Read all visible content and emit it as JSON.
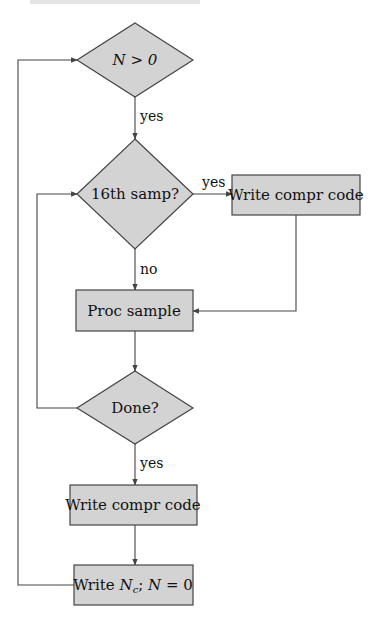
{
  "colors": {
    "node_fill": "#d3d3d3",
    "stroke": "#444444",
    "text": "#111111",
    "background": "#ffffff"
  },
  "nodes": [
    {
      "id": "n_gt_0",
      "type": "decision",
      "label": "N > 0"
    },
    {
      "id": "sample16",
      "type": "decision",
      "label": "16th samp?"
    },
    {
      "id": "write_code_right",
      "type": "process",
      "label": "Write compr code"
    },
    {
      "id": "proc_sample",
      "type": "process",
      "label": "Proc sample"
    },
    {
      "id": "done",
      "type": "decision",
      "label": "Done?"
    },
    {
      "id": "write_code_bottom",
      "type": "process",
      "label": "Write compr code"
    },
    {
      "id": "write_nc",
      "type": "process",
      "label_parts": [
        "Write ",
        "N",
        "c",
        "; ",
        "N",
        " = 0"
      ]
    }
  ],
  "edges": [
    {
      "from": "n_gt_0",
      "to": "sample16",
      "label": "yes"
    },
    {
      "from": "sample16",
      "to": "write_code_right",
      "label": "yes"
    },
    {
      "from": "sample16",
      "to": "proc_sample",
      "label": "no"
    },
    {
      "from": "write_code_right",
      "to": "proc_sample",
      "label": ""
    },
    {
      "from": "proc_sample",
      "to": "done",
      "label": ""
    },
    {
      "from": "done",
      "to": "sample16",
      "label": ""
    },
    {
      "from": "done",
      "to": "write_code_bottom",
      "label": "yes"
    },
    {
      "from": "write_code_bottom",
      "to": "write_nc",
      "label": ""
    },
    {
      "from": "write_nc",
      "to": "n_gt_0",
      "label": ""
    }
  ]
}
